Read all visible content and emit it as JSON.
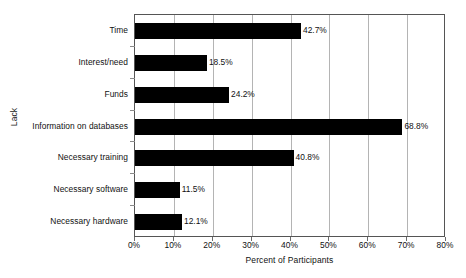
{
  "chart_data": {
    "type": "bar",
    "orientation": "horizontal",
    "title": "",
    "xlabel": "Percent of Participants",
    "ylabel": "Lack",
    "categories": [
      "Time",
      "Interest/need",
      "Funds",
      "Information on databases",
      "Necessary training",
      "Necessary software",
      "Necessary hardware"
    ],
    "values": [
      42.7,
      18.5,
      24.2,
      68.8,
      40.8,
      11.5,
      12.1
    ],
    "value_labels": [
      "42.7%",
      "18.5%",
      "24.2%",
      "68.8%",
      "40.8%",
      "11.5%",
      "12.1%"
    ],
    "xlim": [
      0,
      80
    ],
    "xticks": [
      0,
      10,
      20,
      30,
      40,
      50,
      60,
      70,
      80
    ],
    "xtick_labels": [
      "0%",
      "10%",
      "20%",
      "30%",
      "40%",
      "50%",
      "60%",
      "70%",
      "80%"
    ],
    "grid": "vertical",
    "legend": null,
    "bar_color": "#000000",
    "grid_color": "#b4b4b4",
    "axis_color": "#555555",
    "background": "#ffffff"
  }
}
